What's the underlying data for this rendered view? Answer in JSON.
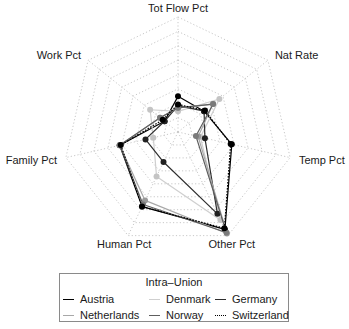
{
  "chart_data": {
    "type": "radar",
    "title": "",
    "axes": [
      "Tot Flow Pct",
      "Nat Rate",
      "Temp Pct",
      "Other Pct",
      "Human Pct",
      "Family Pct",
      "Work Pct"
    ],
    "range": [
      0,
      1
    ],
    "rings": 8,
    "grid": true,
    "grid_style": "dotted",
    "grid_color": "#c8c8c8",
    "legend": {
      "title": "Intra–Union",
      "position": "bottom",
      "columns": 3
    },
    "series": [
      {
        "name": "Austria",
        "values": [
          0.31,
          0.29,
          0.48,
          0.94,
          0.72,
          0.52,
          0.15
        ],
        "color": "#000000",
        "marker_color": "#000000",
        "line_style": "solid"
      },
      {
        "name": "Denmark",
        "values": [
          0.18,
          0.46,
          0.2,
          0.85,
          0.43,
          0.22,
          0.31
        ],
        "color": "#cfcfcf",
        "marker_color": "#c4c4c4",
        "line_style": "solid"
      },
      {
        "name": "Germany",
        "values": [
          0.23,
          0.29,
          0.24,
          0.79,
          0.29,
          0.29,
          0.15
        ],
        "color": "#2e2e2e",
        "marker_color": "#202020",
        "line_style": "solid"
      },
      {
        "name": "Netherlands",
        "values": [
          0.21,
          0.39,
          0.18,
          0.98,
          0.66,
          0.52,
          0.2
        ],
        "color": "#a8a8a8",
        "marker_color": "#9a9a9a",
        "line_style": "solid"
      },
      {
        "name": "Norway",
        "values": [
          0.21,
          0.39,
          0.16,
          0.97,
          0.7,
          0.52,
          0.2
        ],
        "color": "#5e5e5e",
        "marker_color": "#7a7a7a",
        "line_style": "solid"
      },
      {
        "name": "Switzerland",
        "values": [
          0.24,
          0.3,
          0.47,
          0.93,
          0.72,
          0.51,
          0.17
        ],
        "color": "#000000",
        "marker_color": "#000000",
        "line_style": "dotted"
      }
    ]
  }
}
